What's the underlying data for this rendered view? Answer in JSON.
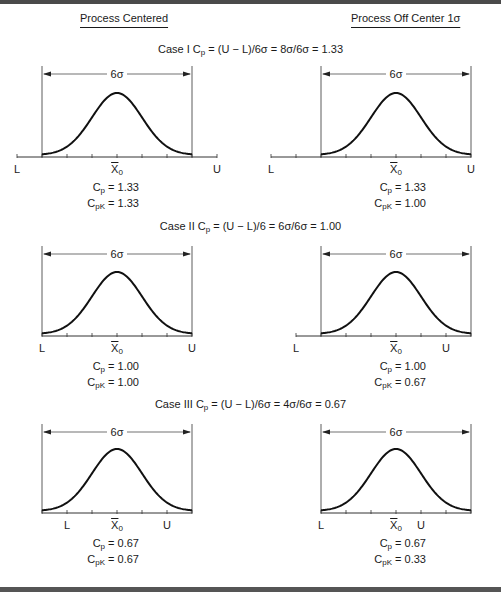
{
  "headers": {
    "left": "Process Centered",
    "right": "Process Off Center 1σ"
  },
  "spread_label": "6σ",
  "center_label": "X",
  "center_sub": "0",
  "lower_label": "L",
  "upper_label": "U",
  "cases": [
    {
      "title_prefix": "Case I  C",
      "title_sub": "p",
      "title_rest": " = (U − L)/6σ = 8σ/6σ = 1.33",
      "spec_width_sigma": 8,
      "panels": [
        {
          "offset_sigma": 0,
          "cp": "1.33",
          "cpk": "1.33"
        },
        {
          "offset_sigma": 1,
          "cp": "1.33",
          "cpk": "1.00"
        }
      ]
    },
    {
      "title_prefix": "Case II  C",
      "title_sub": "p",
      "title_rest": " = (U − L)/6 = 6σ/6σ = 1.00",
      "spec_width_sigma": 6,
      "panels": [
        {
          "offset_sigma": 0,
          "cp": "1.00",
          "cpk": "1.00"
        },
        {
          "offset_sigma": 1,
          "cp": "1.00",
          "cpk": "0.67"
        }
      ]
    },
    {
      "title_prefix": "Case III  C",
      "title_sub": "p",
      "title_rest": " = (U − L)/6σ = 4σ/6σ = 0.67",
      "spec_width_sigma": 4,
      "panels": [
        {
          "offset_sigma": 0,
          "cp": "0.67",
          "cpk": "0.67"
        },
        {
          "offset_sigma": 1,
          "cp": "0.67",
          "cpk": "0.33"
        }
      ]
    }
  ],
  "stat_labels": {
    "cp_main": "C",
    "cp_sub": "p",
    "cpk_main": "C",
    "cpk_sub": "pK",
    "eq": " = "
  }
}
